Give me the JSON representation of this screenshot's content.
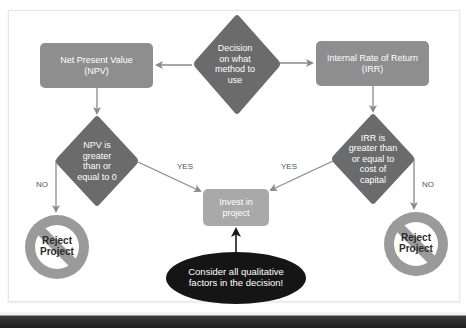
{
  "colors": {
    "process_box": "#8e8e8e",
    "decision_diamond": "#6b6b6b",
    "invest_box": "#a9a9a9",
    "ellipse": "#151515",
    "arrow": "#8a8a8a",
    "reject_ring": "#9a9a9a"
  },
  "nodes": {
    "decision": {
      "label": "Decision on what method to use",
      "lines": [
        "Decision",
        "on what",
        "method to",
        "use"
      ]
    },
    "npv": {
      "label": "Net Present Value (NPV)",
      "lines": [
        "Net Present Value",
        "(NPV)"
      ]
    },
    "irr": {
      "label": "Internal Rate of Return (IRR)",
      "lines": [
        "Internal Rate of Return",
        "(IRR)"
      ]
    },
    "npv_test": {
      "label": "NPV is greater than or equal to 0",
      "lines": [
        "NPV is",
        "greater",
        "than or",
        "equal to 0"
      ]
    },
    "irr_test": {
      "label": "IRR is greater than or equal to cost of capital",
      "lines": [
        "IRR is",
        "greater than",
        "or equal to",
        "cost of",
        "capital"
      ]
    },
    "invest": {
      "label": "Invest in project",
      "lines": [
        "Invest in",
        "project"
      ]
    },
    "qualitative": {
      "label": "Consider all qualitative factors in the decision!",
      "lines": [
        "Consider all qualitative",
        "factors in the decision!"
      ]
    },
    "reject_left": {
      "label": "Reject Project",
      "lines": [
        "Reject",
        "Project"
      ]
    },
    "reject_right": {
      "label": "Reject Project",
      "lines": [
        "Reject",
        "Project"
      ]
    }
  },
  "edges": {
    "npv_yes": "YES",
    "npv_no": "NO",
    "irr_yes": "YES",
    "irr_no": "NO"
  }
}
